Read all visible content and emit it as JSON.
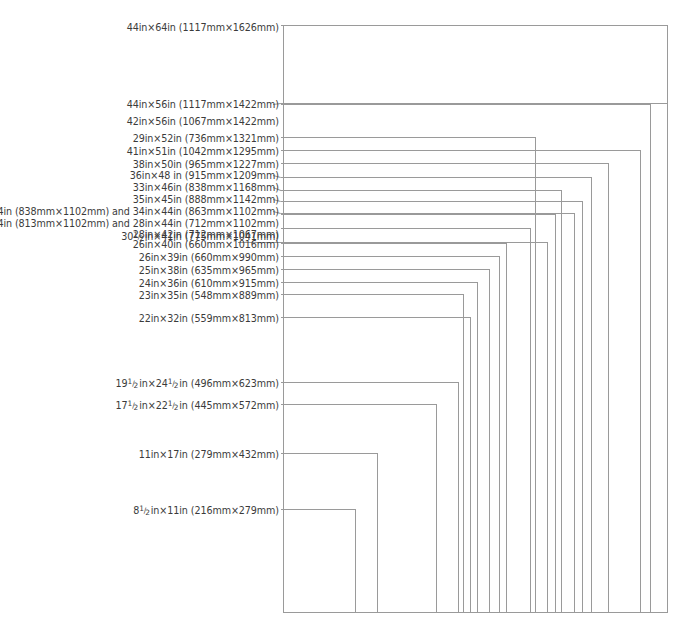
{
  "diagram": {
    "type": "nested-rectangles",
    "background_color": "#ffffff",
    "line_color": "#9a9a9a",
    "text_color": "#3b3b3b",
    "origin": "bottom-left",
    "canvas": {
      "width": 691,
      "height": 634
    },
    "plot_area": {
      "left": 283,
      "bottom": 613,
      "right": 668,
      "top": 25
    }
  },
  "chart_data": {
    "type": "bar",
    "xlabel": "",
    "ylabel": "",
    "grid": false,
    "legend_position": "left",
    "categories": [
      "44in×64in",
      "44in×56in",
      "42in×56in",
      "29in×52in",
      "41in×51in",
      "38in×50in",
      "36in×48 in",
      "33in×46in",
      "35in×45in",
      "33in×44in / 34in×44in",
      "32in×44in / 28in×44in",
      "28in×42in",
      "30½in×41in",
      "26in×40in",
      "26in×39in",
      "25in×38in",
      "24in×36in",
      "23in×35in",
      "22in×32in",
      "19½in×24½in",
      "17½in×22½in",
      "11in×17in",
      "8½in×11in"
    ],
    "series": [
      {
        "name": "width_in",
        "values": [
          44,
          44,
          42,
          29,
          41,
          38,
          36,
          33,
          35,
          34,
          32,
          28,
          30.5,
          26,
          26,
          25,
          24,
          23,
          22,
          19.5,
          17.5,
          11,
          8.5
        ]
      },
      {
        "name": "height_in",
        "values": [
          64,
          56,
          56,
          52,
          51,
          50,
          48,
          46,
          45,
          44,
          44,
          42,
          41,
          40,
          39,
          38,
          36,
          35,
          32,
          24.5,
          22.5,
          17,
          11
        ]
      },
      {
        "name": "width_mm",
        "values": [
          1117,
          1117,
          1067,
          736,
          1042,
          965,
          915,
          838,
          888,
          863,
          813,
          712,
          775,
          660,
          660,
          635,
          610,
          548,
          559,
          496,
          445,
          279,
          216
        ]
      },
      {
        "name": "height_mm",
        "values": [
          1626,
          1422,
          1422,
          1321,
          1295,
          1227,
          1209,
          1168,
          1142,
          1102,
          1102,
          1067,
          1041,
          1016,
          990,
          965,
          915,
          889,
          813,
          623,
          572,
          432,
          279
        ]
      }
    ]
  },
  "sizes": [
    {
      "id": "size-44x64",
      "label": "44in×64in (1117mm×1626mm)",
      "width_in": 44,
      "height_in": 64,
      "width_mm": 1117,
      "height_mm": 1626,
      "label_y": 22,
      "rect_top": 25,
      "rect_right": 668,
      "leader_from": 281,
      "leader_y": 25,
      "kink": false
    },
    {
      "id": "size-44x56",
      "label": "44in×56in (1117mm×1422mm)",
      "width_in": 44,
      "height_in": 56,
      "width_mm": 1117,
      "height_mm": 1422,
      "label_y": 99,
      "rect_top": 103,
      "rect_right": 668,
      "leader_from": 281,
      "leader_y": 103,
      "kink": true
    },
    {
      "id": "size-42x56",
      "label": "42in×56in (1067mm×1422mm)",
      "width_in": 42,
      "height_in": 56,
      "width_mm": 1067,
      "height_mm": 1422,
      "label_y": 116,
      "rect_top": 104,
      "rect_right": 651,
      "leader_from": 281,
      "leader_y": 104,
      "kink": false
    },
    {
      "id": "size-29x52",
      "label": "29in×52in (736mm×1321mm)",
      "width_in": 29,
      "height_in": 52,
      "width_mm": 736,
      "height_mm": 1321,
      "label_y": 133,
      "rect_top": 137,
      "rect_right": 536,
      "leader_from": 281,
      "leader_y": 137,
      "kink": false
    },
    {
      "id": "size-41x51",
      "label": "41in×51in (1042mm×1295mm)",
      "width_in": 41,
      "height_in": 51,
      "width_mm": 1042,
      "height_mm": 1295,
      "label_y": 146,
      "rect_top": 150,
      "rect_right": 641,
      "leader_from": 281,
      "leader_y": 150,
      "kink": false
    },
    {
      "id": "size-38x50",
      "label": "38in×50in (965mm×1227mm)",
      "width_in": 38,
      "height_in": 50,
      "width_mm": 965,
      "height_mm": 1227,
      "label_y": 159,
      "rect_top": 163,
      "rect_right": 609,
      "leader_from": 281,
      "leader_y": 163,
      "kink": false
    },
    {
      "id": "size-36x48",
      "label": "36in×48 in (915mm×1209mm)",
      "width_in": 36,
      "height_in": 48,
      "width_mm": 915,
      "height_mm": 1209,
      "label_y": 170,
      "rect_top": 177,
      "rect_right": 592,
      "leader_from": 281,
      "leader_y": 177,
      "kink": true
    },
    {
      "id": "size-33x46",
      "label": "33in×46in (838mm×1168mm)",
      "width_in": 33,
      "height_in": 46,
      "width_mm": 838,
      "height_mm": 1168,
      "label_y": 182,
      "rect_top": 190,
      "rect_right": 562,
      "leader_from": 281,
      "leader_y": 190,
      "kink": true
    },
    {
      "id": "size-35x45",
      "label": "35in×45in (888mm×1142mm)",
      "width_in": 35,
      "height_in": 45,
      "width_mm": 888,
      "height_mm": 1142,
      "label_y": 194,
      "rect_top": 201,
      "rect_right": 583,
      "leader_from": 281,
      "leader_y": 201,
      "kink": true
    },
    {
      "id": "size-33-34x44",
      "label": "33in×44in (838mm×1102mm) and 34in×44in (863mm×1102mm)",
      "width_in": 34,
      "height_in": 44,
      "width_mm": 863,
      "height_mm": 1102,
      "label_y": 206,
      "rect_top": 213,
      "rect_right": 575,
      "leader_from": 281,
      "leader_y": 213,
      "kink": true
    },
    {
      "id": "size-32-28x44",
      "label": "32in×44in (813mm×1102mm) and 28in×44in (712mm×1102mm)",
      "width_in": 32,
      "height_in": 44,
      "width_mm": 813,
      "height_mm": 1102,
      "label_y": 218,
      "rect_top": 214,
      "rect_right": 556,
      "leader_from": 281,
      "leader_y": 214,
      "kink": false
    },
    {
      "id": "size-28x42",
      "label": "28in×42in (712mm×1067mm)",
      "width_in": 28,
      "height_in": 42,
      "width_mm": 712,
      "height_mm": 1067,
      "label_y": 229,
      "rect_top": 228,
      "rect_right": 531,
      "leader_from": 281,
      "leader_y": 228,
      "kink": false
    },
    {
      "id": "size-30h-x41",
      "label": "30½in×41in (775mm×1041mm)",
      "width_in": 30.5,
      "height_in": 41,
      "width_mm": 775,
      "height_mm": 1041,
      "label_y": 231,
      "rect_top": 242,
      "rect_right": 548,
      "leader_from": 238,
      "leader_y": 242,
      "kink": false,
      "long_leader": true
    },
    {
      "id": "size-26x40",
      "label": "26in×40in (660mm×1016mm)",
      "width_in": 26,
      "height_in": 40,
      "width_mm": 660,
      "height_mm": 1016,
      "label_y": 239,
      "rect_top": 243,
      "rect_right": 507,
      "leader_from": 281,
      "leader_y": 243,
      "kink": false
    },
    {
      "id": "size-26x39",
      "label": "26in×39in (660mm×990mm)",
      "width_in": 26,
      "height_in": 39,
      "width_mm": 660,
      "height_mm": 990,
      "label_y": 252,
      "rect_top": 256,
      "rect_right": 500,
      "leader_from": 281,
      "leader_y": 256,
      "kink": false
    },
    {
      "id": "size-25x38",
      "label": "25in×38in (635mm×965mm)",
      "width_in": 25,
      "height_in": 38,
      "width_mm": 635,
      "height_mm": 965,
      "label_y": 265,
      "rect_top": 269,
      "rect_right": 490,
      "leader_from": 281,
      "leader_y": 269,
      "kink": false
    },
    {
      "id": "size-24x36",
      "label": "24in×36in (610mm×915mm)",
      "width_in": 24,
      "height_in": 36,
      "width_mm": 610,
      "height_mm": 915,
      "label_y": 278,
      "rect_top": 282,
      "rect_right": 478,
      "leader_from": 281,
      "leader_y": 282,
      "kink": false
    },
    {
      "id": "size-23x35",
      "label": "23in×35in (548mm×889mm)",
      "width_in": 23,
      "height_in": 35,
      "width_mm": 548,
      "height_mm": 889,
      "label_y": 290,
      "rect_top": 294,
      "rect_right": 464,
      "leader_from": 281,
      "leader_y": 294,
      "kink": false
    },
    {
      "id": "size-22x32",
      "label": "22in×32in (559mm×813mm)",
      "width_in": 22,
      "height_in": 32,
      "width_mm": 559,
      "height_mm": 813,
      "label_y": 313,
      "rect_top": 317,
      "rect_right": 471,
      "leader_from": 281,
      "leader_y": 317,
      "kink": false
    },
    {
      "id": "size-19h-x24h",
      "label": "19½in×24½in (496mm×623mm)",
      "width_in": 19.5,
      "height_in": 24.5,
      "width_mm": 496,
      "height_mm": 623,
      "label_y": 378,
      "rect_top": 382,
      "rect_right": 459,
      "leader_from": 281,
      "leader_y": 382,
      "kink": false
    },
    {
      "id": "size-17h-x22h",
      "label": "17½in×22½in (445mm×572mm)",
      "width_in": 17.5,
      "height_in": 22.5,
      "width_mm": 445,
      "height_mm": 572,
      "label_y": 400,
      "rect_top": 404,
      "rect_right": 437,
      "leader_from": 281,
      "leader_y": 404,
      "kink": false
    },
    {
      "id": "size-11x17",
      "label": "11in×17in (279mm×432mm)",
      "width_in": 11,
      "height_in": 17,
      "width_mm": 279,
      "height_mm": 432,
      "label_y": 449,
      "rect_top": 453,
      "rect_right": 378,
      "leader_from": 281,
      "leader_y": 453,
      "kink": false
    },
    {
      "id": "size-8h-x11",
      "label": "8½in×11in (216mm×279mm)",
      "width_in": 8.5,
      "height_in": 11,
      "width_mm": 216,
      "height_mm": 279,
      "label_y": 505,
      "rect_top": 509,
      "rect_right": 356,
      "leader_from": 281,
      "leader_y": 509,
      "kink": false
    }
  ]
}
